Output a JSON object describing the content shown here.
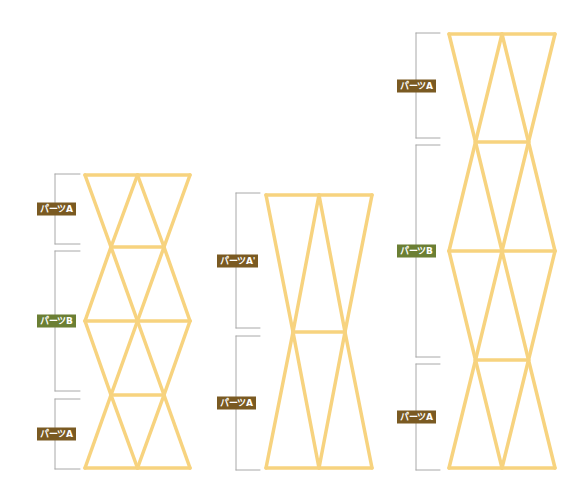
{
  "colors": {
    "frame": "#f7d37f",
    "bracket": "#a8a8a8",
    "label_a": "#7a5a22",
    "label_b": "#6b7f34"
  },
  "structures": [
    {
      "name": "left-structure",
      "cx": 137.5,
      "outer_half": 52.5,
      "inner_half": 26.5,
      "levels": [
        {
          "y": 175,
          "wide": true
        },
        {
          "y": 247,
          "wide": false
        },
        {
          "y": 321,
          "wide": true
        },
        {
          "y": 395,
          "wide": false
        },
        {
          "y": 468,
          "wide": true
        }
      ],
      "brackets": [
        {
          "label": "パーツA",
          "type": "a",
          "y1": 174,
          "y2": 244,
          "x": 55,
          "tick_to": 80,
          "label_x": 37
        },
        {
          "label": "パーツB",
          "type": "b",
          "y1": 251,
          "y2": 391,
          "x": 55,
          "tick_to": 80,
          "label_x": 37
        },
        {
          "label": "パーツA",
          "type": "a",
          "y1": 399,
          "y2": 469,
          "x": 55,
          "tick_to": 80,
          "label_x": 37
        }
      ]
    },
    {
      "name": "middle-structure",
      "cx": 319,
      "outer_half": 53,
      "inner_half": 26,
      "levels": [
        {
          "y": 195,
          "wide": true
        },
        {
          "y": 332,
          "wide": false
        },
        {
          "y": 468,
          "wide": true
        }
      ],
      "brackets": [
        {
          "label": "パーツA'",
          "type": "a",
          "y1": 193,
          "y2": 328,
          "x": 236,
          "tick_to": 260,
          "label_x": 217
        },
        {
          "label": "パーツA",
          "type": "a",
          "y1": 336,
          "y2": 470,
          "x": 236,
          "tick_to": 260,
          "label_x": 217
        }
      ]
    },
    {
      "name": "right-structure",
      "cx": 502,
      "outer_half": 53,
      "inner_half": 26.5,
      "levels": [
        {
          "y": 34,
          "wide": true
        },
        {
          "y": 142,
          "wide": false
        },
        {
          "y": 251,
          "wide": true
        },
        {
          "y": 360,
          "wide": false
        },
        {
          "y": 468,
          "wide": true
        }
      ],
      "brackets": [
        {
          "label": "パーツA",
          "type": "a",
          "y1": 33,
          "y2": 138,
          "x": 416,
          "tick_to": 440,
          "label_x": 397
        },
        {
          "label": "パーツB",
          "type": "b",
          "y1": 145,
          "y2": 357,
          "x": 416,
          "tick_to": 440,
          "label_x": 397
        },
        {
          "label": "パーツA",
          "type": "a",
          "y1": 364,
          "y2": 470,
          "x": 416,
          "tick_to": 440,
          "label_x": 397
        }
      ]
    }
  ]
}
